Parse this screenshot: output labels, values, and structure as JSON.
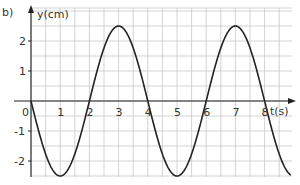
{
  "figure_label": "b)",
  "chart_data": {
    "type": "line",
    "title": "",
    "xlabel": "t(s)",
    "ylabel": "y(cm)",
    "xlim": [
      0,
      8.9
    ],
    "ylim": [
      -2.5,
      2.5
    ],
    "x_ticks": [
      "0",
      "1",
      "2",
      "3",
      "4",
      "5",
      "6",
      "7",
      "8"
    ],
    "y_ticks": [
      "2",
      "1",
      "-1",
      "-2"
    ],
    "grid": true,
    "grid_step": {
      "x": 0.5,
      "y": 0.5
    },
    "series": [
      {
        "name": "y(t)",
        "function": "y = -2.5 sin(pi t / 2)",
        "amplitude": 2.5,
        "period": 4,
        "x": [
          0,
          1,
          2,
          3,
          4,
          5,
          6,
          7,
          8,
          8.9
        ],
        "values": [
          0,
          -2.5,
          0,
          2.5,
          0,
          -2.5,
          0,
          2.5,
          0,
          -2.47
        ]
      }
    ],
    "colors": {
      "curve": "#222222",
      "grid": "#c8c8c8",
      "axis": "#222222"
    }
  }
}
